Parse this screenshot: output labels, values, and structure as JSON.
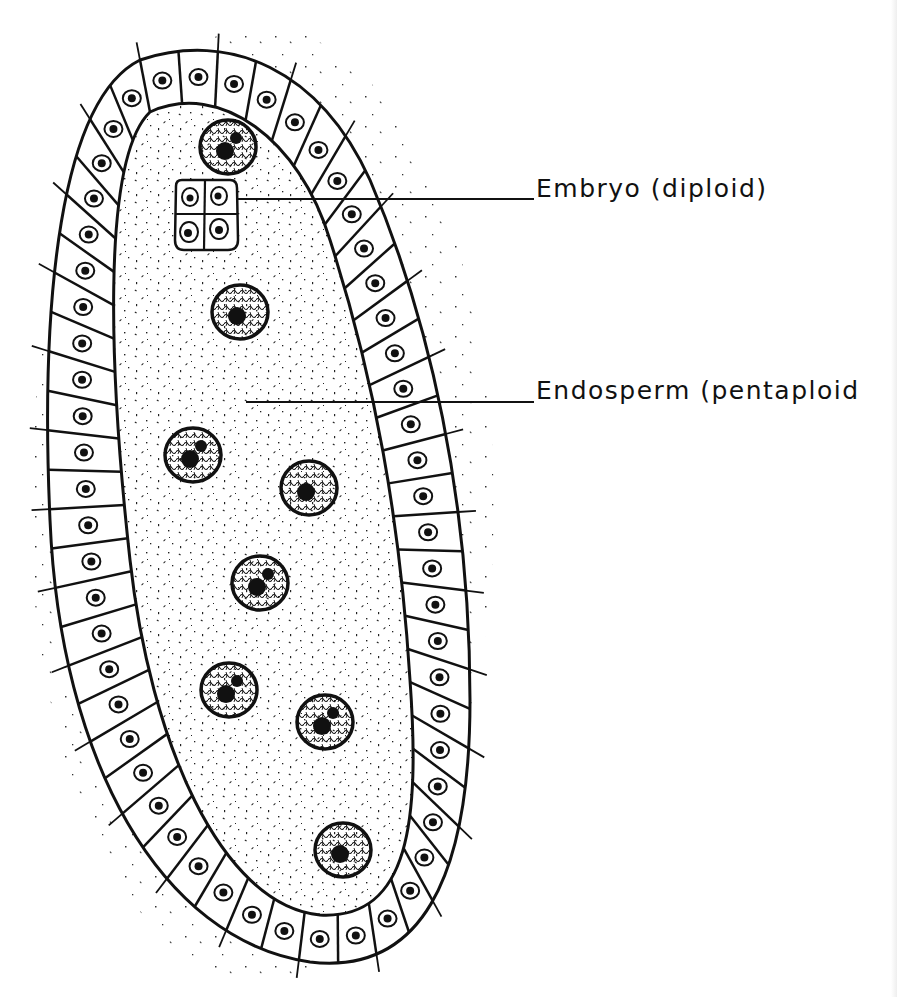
{
  "figure": {
    "type": "biological-line-drawing"
  },
  "labels": [
    {
      "id": "embryo",
      "text": "Embryo (diploid)",
      "pointer_from": [
        238,
        199
      ],
      "pointer_to": [
        534,
        199
      ]
    },
    {
      "id": "endosperm",
      "text": "Endosperm (pentaploid",
      "pointer_from": [
        246,
        402
      ],
      "pointer_to": [
        534,
        402
      ]
    }
  ],
  "structures": {
    "outer_cell_layer": {
      "description": "single layer of rectangular cells each with a small nucleus",
      "approx_cell_count": 56
    },
    "embryo": {
      "description": "four-celled embryo cluster",
      "cell_count": 4,
      "center": [
        205,
        215
      ]
    },
    "endosperm_nuclei": {
      "description": "large nuclei with granular chromatin and dark nucleoli in stippled cytoplasm",
      "count": 9,
      "positions": [
        [
          228,
          147
        ],
        [
          240,
          312
        ],
        [
          193,
          455
        ],
        [
          309,
          488
        ],
        [
          260,
          583
        ],
        [
          229,
          690
        ],
        [
          325,
          722
        ],
        [
          343,
          850
        ]
      ]
    }
  },
  "colors": {
    "ink": "#111111",
    "background": "#ffffff"
  }
}
